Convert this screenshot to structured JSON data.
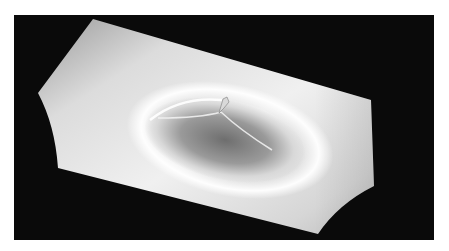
{
  "image": {
    "description": "Grayscale 3D render of a warped rectangular membrane surface with a central circular dimple and a small spike at the top of the dimple, on a black background",
    "background_color": "#0a0a0a",
    "surface_color_light": "#f2f2f2",
    "surface_color_mid": "#c8c8c8",
    "dimple_shadow_color": "#6e6e6e",
    "rim_highlight_color": "#ffffff"
  }
}
